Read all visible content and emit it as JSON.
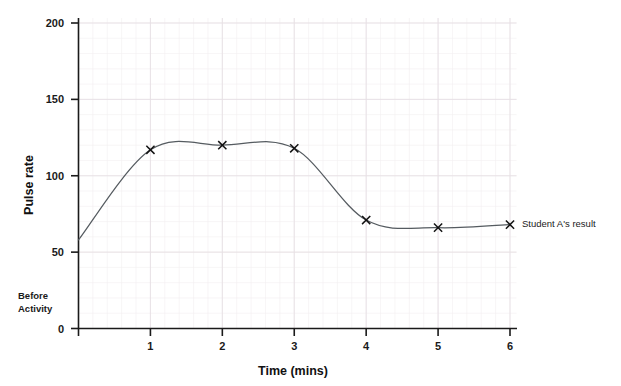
{
  "chart_data": {
    "type": "line",
    "title": "",
    "xlabel": "Time (mins)",
    "ylabel": "Pulse rate",
    "xlim": [
      0,
      6.2
    ],
    "ylim": [
      0,
      200
    ],
    "grid": true,
    "legend_position": "none",
    "x_ticks": [
      "1",
      "2",
      "3",
      "4",
      "5",
      "6"
    ],
    "x_tick_values": [
      1,
      2,
      3,
      4,
      5,
      6
    ],
    "y_ticks": [
      "0",
      "50",
      "100",
      "150",
      "200"
    ],
    "y_tick_values": [
      0,
      50,
      100,
      150,
      200
    ],
    "series": [
      {
        "name": "Student A's result",
        "marker": "x",
        "color": "#555b60",
        "x": [
          0,
          1,
          2,
          3,
          4,
          5,
          6
        ],
        "values": [
          58,
          117,
          120,
          118,
          71,
          66,
          68
        ]
      }
    ],
    "annotations": [
      {
        "text": "Student A's result",
        "at_x": 6,
        "at_y": 68,
        "position": "right-of-last-point"
      },
      {
        "text": "Before Activity",
        "line1": "Before",
        "line2": "Activity",
        "position": "left-of-y-axis-near-zero"
      }
    ]
  },
  "axes": {
    "y_title": "Pulse rate",
    "x_title": "Time (mins)",
    "y_tick_labels": [
      "200",
      "150",
      "100",
      "50",
      "0"
    ],
    "x_tick_labels": [
      "1",
      "2",
      "3",
      "4",
      "5",
      "6"
    ]
  },
  "notes": {
    "before_line1": "Before",
    "before_line2": "Activity"
  },
  "annotation": {
    "student_result": "Student A's result"
  },
  "colors": {
    "curve": "#555b60",
    "axis": "#1a1a1a",
    "grid_minor": "#f2eef0",
    "grid_major": "#e6e0e4",
    "marker": "#121212",
    "background": "#ffffff"
  }
}
